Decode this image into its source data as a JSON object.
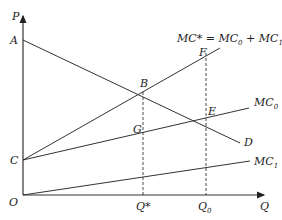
{
  "diagram": {
    "axes": {
      "y_label": "P",
      "x_label": "Q",
      "origin_label": "O"
    },
    "points": {
      "A": "A",
      "B": "B",
      "C": "C",
      "D": "D",
      "E": "E",
      "F": "F",
      "G": "G"
    },
    "x_ticks": {
      "q_star": "Q*",
      "q0_main": "Q",
      "q0_sub": "0"
    },
    "curves": {
      "mc_star_formula_main": "MC* = MC",
      "mc_star_formula_sub0": "0",
      "mc_star_formula_plus": " + MC",
      "mc_star_formula_sub1": "1",
      "mc0_main": "MC",
      "mc0_sub": "0",
      "mc1_main": "MC",
      "mc1_sub": "1",
      "demand": "D"
    },
    "colors": {
      "line": "#333333",
      "text": "#222222"
    }
  }
}
